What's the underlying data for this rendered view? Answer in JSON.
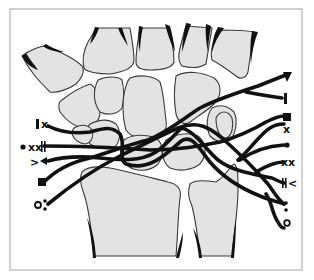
{
  "figure": {
    "colors": {
      "bone_fill": "#e3e3e3",
      "outline": "#3a3a3a",
      "pathway": "#111111",
      "frame": "#b4b4b4"
    }
  },
  "bones": {
    "metacarpals": [
      "metacarpal-1",
      "metacarpal-2",
      "metacarpal-3",
      "metacarpal-4",
      "metacarpal-5"
    ],
    "carpals": [
      "trapezium",
      "trapezoid",
      "capitate",
      "hamate",
      "scaphoid",
      "lunate",
      "triquetrum",
      "pisiform"
    ],
    "forearm": [
      "radius",
      "ulna"
    ]
  },
  "labels": {
    "left": [
      {
        "id": "l1",
        "text": "I x",
        "symbols": [
          "bar",
          "x"
        ]
      },
      {
        "id": "l2",
        "text": "• xx||",
        "symbols": [
          "dot",
          "xx",
          "double-bar"
        ]
      },
      {
        "id": "l3",
        "text": "> ◄",
        "symbols": [
          "chevron",
          "triangle-left"
        ]
      },
      {
        "id": "l4",
        "text": "■",
        "symbols": [
          "square"
        ]
      },
      {
        "id": "l5",
        "text": "o:",
        "symbols": [
          "circle",
          "colon"
        ]
      }
    ],
    "right": [
      {
        "id": "r1",
        "text": "▼",
        "symbols": [
          "triangle-down"
        ]
      },
      {
        "id": "r2",
        "text": "I",
        "symbols": [
          "bar"
        ]
      },
      {
        "id": "r3",
        "text": "■",
        "symbols": [
          "square"
        ]
      },
      {
        "id": "r4",
        "text": "x",
        "symbols": [
          "x"
        ]
      },
      {
        "id": "r5",
        "text": "•",
        "symbols": [
          "dot"
        ]
      },
      {
        "id": "r6",
        "text": "xx",
        "symbols": [
          "xx"
        ]
      },
      {
        "id": "r7",
        "text": "||<",
        "symbols": [
          "double-bar",
          "chevron"
        ]
      },
      {
        "id": "r8",
        "text": ":",
        "symbols": [
          "colon"
        ]
      },
      {
        "id": "r9",
        "text": "o",
        "symbols": [
          "circle"
        ]
      }
    ],
    "text": {
      "x": "x",
      "xx": "xx",
      "lt": "<",
      "gt": ">"
    }
  }
}
